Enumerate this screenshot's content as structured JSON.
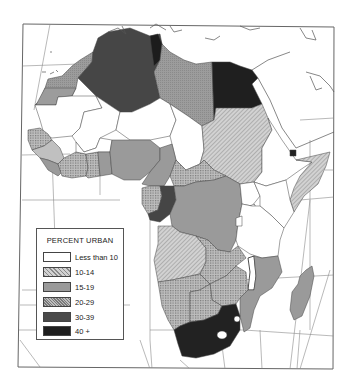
{
  "map": {
    "title": "PERCENT URBAN",
    "region": "Africa",
    "legend": {
      "title": "PERCENT URBAN",
      "items": [
        {
          "label": "Less than 10",
          "fill": "#ffffff",
          "pattern": "none"
        },
        {
          "label": "10-14",
          "fill": "#c8c8c8",
          "pattern": "fine-hatch"
        },
        {
          "label": "15-19",
          "fill": "#9a9a9a",
          "pattern": "solid"
        },
        {
          "label": "20-29",
          "fill": "#b4b4b4",
          "pattern": "cross-hatch"
        },
        {
          "label": "30-39",
          "fill": "#4a4a4a",
          "pattern": "solid"
        },
        {
          "label": "40 +",
          "fill": "#1e1e1e",
          "pattern": "solid"
        }
      ]
    },
    "colors": {
      "background": "#ffffff",
      "border": "#555555",
      "graticule": "#888888"
    }
  }
}
